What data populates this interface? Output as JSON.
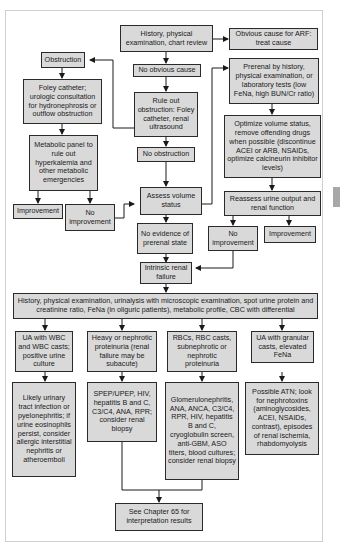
{
  "flowchart": {
    "start": "History, physical examination, chart review",
    "obvious_cause": "Obvious cause for ARF: treat cause",
    "no_obvious_cause": "No obvious cause",
    "rule_out_obstruction": "Rule out obstruction: Foley catheter, renal ultrasound",
    "obstruction": "Obstruction",
    "foley_urology": "Foley catheter; urologic consultation for hydronephrosis or outflow obstruction",
    "metabolic_panel": "Metabolic panel to rule out hyperkalemia and other metabolic emergencies",
    "improvement_left": "Improvement",
    "no_improvement_left": "No improvement",
    "no_obstruction": "No obstruction",
    "assess_volume": "Assess volume status",
    "no_prerenal_evidence": "No evidence of prerenal state",
    "prerenal": "Prerenal by history, physical examination, or laboratory tests (low FeNa, high BUN/Cr ratio)",
    "optimize_volume": "Optimize volume status, remove offending drugs when possible (discontinue ACEI or ARB, NSAIDs, optimize calcineurin inhibitor levels)",
    "reassess": "Reassess urine output and renal function",
    "no_improvement_right": "No improvement",
    "improvement_right": "Improvement",
    "intrinsic": "Intrinsic renal failure",
    "workup": "History, physical examination, urinalysis with microscopic examination, spot urine protein and creatinine ratio, FeNa (in oliguric patients), metabolic profile, CBC with differential",
    "branches": [
      {
        "finding": "UA with WBC and WBC casts; positive urine culture",
        "action": "Likely urinary tract infection or pyelonephritis; if urine eosinophils persist, consider allergic interstitial nephritis or atheroemboli"
      },
      {
        "finding": "Heavy or nephrotic proteinuria (renal failure may be subacute)",
        "action": "SPEP/UPEP, HIV, hepatitis B and C, C3/C4, ANA, RPR; consider renal biopsy"
      },
      {
        "finding": "RBCs, RBC casts, subnephrotic or nephrotic proteinuria",
        "action": "Glomerulonephritis, ANA, ANCA, C3/C4, RPR, HIV, hepatitis B and C, cryoglobulin screen, anti-GBM, ASO titers, blood cultures; consider renal biopsy"
      },
      {
        "finding": "UA with granular casts, elevated FeNa",
        "action": "Possible ATN; look for nephrotoxins (aminoglycosides, ACEI, NSAIDs, contrast), episodes of renal ischemia, rhabdomyolysis"
      }
    ],
    "see_chapter": "See Chapter 65 for interpretation results"
  }
}
